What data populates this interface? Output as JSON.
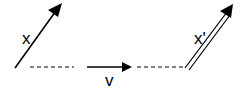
{
  "diagram": {
    "vector_x": {
      "label": "x"
    },
    "vector_v": {
      "label": "v"
    },
    "vector_x_prime": {
      "label": "x'"
    },
    "color": "#000000"
  }
}
